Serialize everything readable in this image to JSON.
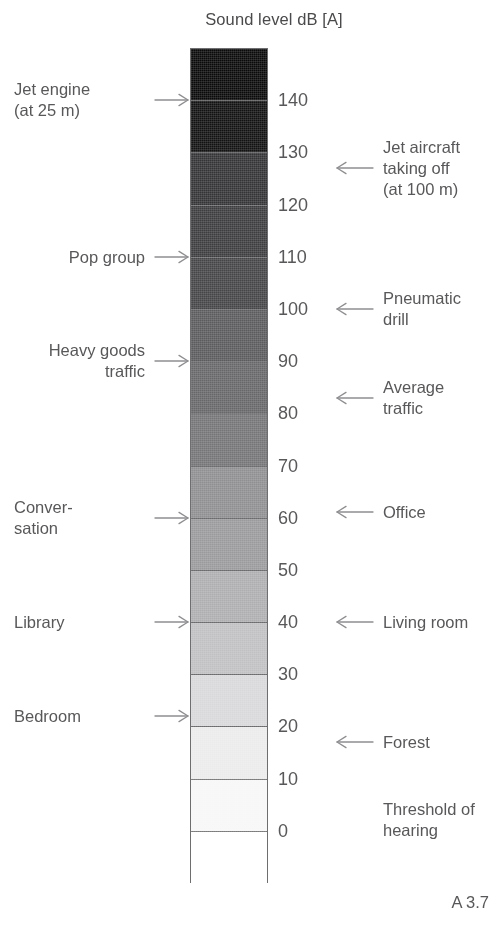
{
  "title": "Sound level dB [A]",
  "caption": "A 3.7",
  "chart_data": {
    "type": "bar",
    "title": "Sound level dB [A]",
    "xlabel": "",
    "ylabel": "Sound level dB [A]",
    "ylim": [
      -10,
      150
    ],
    "grid": false,
    "legend": "none",
    "orientation": "vertical",
    "tick_values": [
      140,
      130,
      120,
      110,
      100,
      90,
      80,
      70,
      60,
      50,
      40,
      30,
      20,
      10,
      0
    ],
    "tick_labels": [
      "140",
      "130",
      "120",
      "110",
      "100",
      "90",
      "80",
      "70",
      "60",
      "50",
      "40",
      "30",
      "20",
      "10",
      "0"
    ],
    "bands": [
      {
        "from": 140,
        "to": 150,
        "color": "#0a0a0a"
      },
      {
        "from": 130,
        "to": 140,
        "color": "#121212"
      },
      {
        "from": 120,
        "to": 130,
        "color": "#343436"
      },
      {
        "from": 110,
        "to": 120,
        "color": "#3d3d3f"
      },
      {
        "from": 100,
        "to": 110,
        "color": "#454547"
      },
      {
        "from": 90,
        "to": 100,
        "color": "#5b5b5d"
      },
      {
        "from": 80,
        "to": 90,
        "color": "#67676a"
      },
      {
        "from": 70,
        "to": 80,
        "color": "#757578"
      },
      {
        "from": 60,
        "to": 70,
        "color": "#8f8f92"
      },
      {
        "from": 50,
        "to": 60,
        "color": "#9a9a9d"
      },
      {
        "from": 40,
        "to": 50,
        "color": "#aeaeb1"
      },
      {
        "from": 30,
        "to": 40,
        "color": "#c0c0c3"
      },
      {
        "from": 20,
        "to": 30,
        "color": "#d8d8da"
      },
      {
        "from": 10,
        "to": 20,
        "color": "#ebebec"
      },
      {
        "from": 0,
        "to": 10,
        "color": "#f7f7f7"
      },
      {
        "from": -10,
        "to": 0,
        "color": "#ffffff"
      }
    ],
    "annotations_left": [
      {
        "label": "Jet engine\n(at 25 m)",
        "level": 140,
        "align": "left",
        "arrow": "right"
      },
      {
        "label": "Pop group",
        "level": 110,
        "align": "right",
        "arrow": "right"
      },
      {
        "label": "Heavy goods\ntraffic",
        "level": 90,
        "align": "right",
        "arrow": "right"
      },
      {
        "label": "Conver-\nsation",
        "level": 60,
        "align": "left",
        "arrow": "right"
      },
      {
        "label": "Library",
        "level": 40,
        "align": "left",
        "arrow": "right"
      },
      {
        "label": "Bedroom",
        "level": 22,
        "align": "left",
        "arrow": "right"
      }
    ],
    "annotations_right": [
      {
        "label": "Jet aircraft\ntaking off\n(at 100 m)",
        "level": 127,
        "arrow": "left"
      },
      {
        "label": "Pneumatic\ndrill",
        "level": 100,
        "arrow": "left"
      },
      {
        "label": "Average\ntraffic",
        "level": 83,
        "arrow": "left"
      },
      {
        "label": "Office",
        "level": 61,
        "arrow": "left"
      },
      {
        "label": "Living room",
        "level": 40,
        "arrow": "left"
      },
      {
        "label": "Forest",
        "level": 17,
        "arrow": "left"
      },
      {
        "label": "Threshold of\nhearing",
        "level": 2,
        "arrow": "none"
      }
    ]
  }
}
